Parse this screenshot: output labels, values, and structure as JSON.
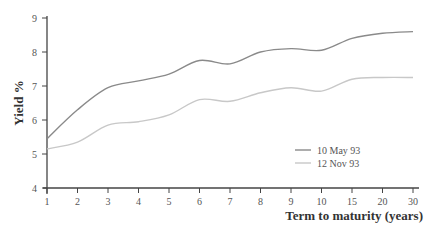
{
  "chart_data": {
    "type": "line",
    "title": "",
    "xlabel": "Term to maturity (years)",
    "ylabel": "Yield %",
    "categories": [
      "1",
      "2",
      "3",
      "4",
      "5",
      "6",
      "7",
      "8",
      "9",
      "10",
      "15",
      "20",
      "30"
    ],
    "ylim": [
      4,
      9
    ],
    "yticks": [
      "4",
      "5",
      "6",
      "7",
      "8",
      "9"
    ],
    "grid": false,
    "legend_position": "lower-right (inside plot)",
    "series": [
      {
        "name": "10 May 93",
        "color": "#8a8a8a",
        "values": [
          5.45,
          6.3,
          6.95,
          7.15,
          7.35,
          7.75,
          7.65,
          8.0,
          8.1,
          8.05,
          8.4,
          8.55,
          8.6
        ]
      },
      {
        "name": "12 Nov 93",
        "color": "#c8c8c8",
        "values": [
          5.15,
          5.35,
          5.85,
          5.95,
          6.15,
          6.6,
          6.55,
          6.8,
          6.95,
          6.85,
          7.2,
          7.25,
          7.25
        ]
      }
    ]
  }
}
